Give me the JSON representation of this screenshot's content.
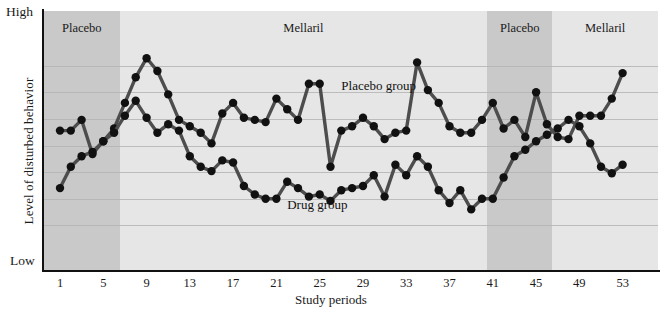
{
  "chart_data": {
    "type": "line",
    "title": "",
    "xlabel": "Study periods",
    "ylabel": "Level of disturbed behavior",
    "y_axis_top_label": "High",
    "y_axis_bottom_label": "Low",
    "grid": true,
    "gridlines": 7,
    "legend_position": "inline-annotation",
    "xlim": [
      1,
      53
    ],
    "ylim": [
      0,
      100
    ],
    "xticks": [
      1,
      5,
      9,
      13,
      17,
      21,
      25,
      29,
      33,
      37,
      41,
      45,
      49,
      53
    ],
    "phases": [
      {
        "label": "Placebo",
        "start": 1,
        "end": 7,
        "shade": "dark"
      },
      {
        "label": "Mellaril",
        "start": 7,
        "end": 41,
        "shade": "light"
      },
      {
        "label": "Placebo",
        "start": 41,
        "end": 47,
        "shade": "dark"
      },
      {
        "label": "Mellaril",
        "start": 47,
        "end": 54,
        "shade": "light"
      }
    ],
    "x": [
      1,
      2,
      3,
      4,
      5,
      6,
      7,
      8,
      9,
      10,
      11,
      12,
      13,
      14,
      15,
      16,
      17,
      18,
      19,
      20,
      21,
      22,
      23,
      24,
      25,
      26,
      27,
      28,
      29,
      30,
      31,
      32,
      33,
      34,
      35,
      36,
      37,
      38,
      39,
      40,
      41,
      42,
      43,
      44,
      45,
      46,
      47,
      48,
      49,
      50,
      51,
      52,
      53
    ],
    "series": [
      {
        "name": "Placebo group",
        "annotation": "Placebo group",
        "values": [
          57,
          57,
          62,
          46,
          52,
          58,
          70,
          82,
          91,
          85,
          74,
          62,
          59,
          56,
          51,
          65,
          70,
          63,
          62,
          61,
          72,
          67,
          62,
          79,
          79,
          40,
          57,
          59,
          63,
          59,
          53,
          56,
          57,
          89,
          76,
          70,
          59,
          56,
          56,
          62,
          70,
          58,
          62,
          54,
          75,
          60,
          54,
          53,
          64,
          64,
          64,
          72,
          84
        ]
      },
      {
        "name": "Drug group",
        "annotation": "Drug group",
        "values": [
          30,
          40,
          45,
          47,
          52,
          56,
          64,
          71,
          63,
          56,
          60,
          57,
          45,
          40,
          38,
          43,
          42,
          31,
          27,
          25,
          25,
          33,
          30,
          26,
          27,
          24,
          29,
          30,
          31,
          36,
          26,
          41,
          36,
          45,
          40,
          29,
          23,
          29,
          20,
          25,
          25,
          35,
          45,
          48,
          52,
          55,
          58,
          62,
          59,
          51,
          40,
          37,
          41
        ]
      }
    ],
    "annotations": [
      {
        "text": "Placebo group",
        "x_period": 27,
        "level": 78
      },
      {
        "text": "Drug group",
        "x_period": 22,
        "level": 22
      }
    ],
    "colors": {
      "line": "#4d4d4d",
      "marker": "#111111",
      "band_dark": "#c9c9c9",
      "band_light": "#e6e6e6",
      "gridline": "#b4b4b4",
      "axis": "#111111",
      "background": "#ffffff"
    }
  }
}
